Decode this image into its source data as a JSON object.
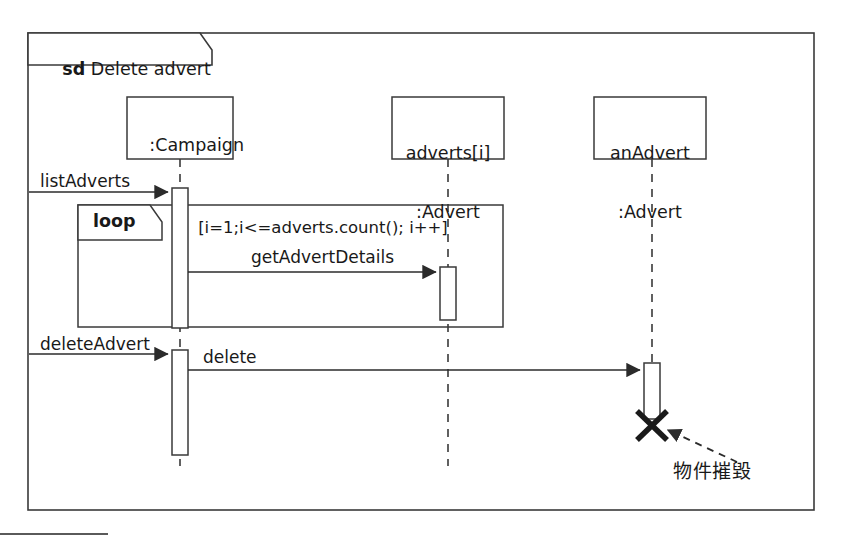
{
  "diagram": {
    "type": "uml-sequence-diagram",
    "frame": {
      "kind_keyword": "sd",
      "title": "Delete advert"
    },
    "lifelines": [
      {
        "id": "campaign",
        "label_line1": ":Campaign",
        "label_line2": ""
      },
      {
        "id": "adverts-i",
        "label_line1": "adverts[i]",
        "label_line2": ":Advert"
      },
      {
        "id": "anadvert",
        "label_line1": "anAdvert",
        "label_line2": ":Advert"
      }
    ],
    "fragment": {
      "operator": "loop",
      "guard": "[i=1;i<=adverts.count(); i++]"
    },
    "messages": [
      {
        "id": "list-adverts",
        "label": "listAdverts",
        "from": "actor-boundary",
        "to": "campaign",
        "style": "solid-filled-arrow"
      },
      {
        "id": "get-advert-details",
        "label": "getAdvertDetails",
        "from": "campaign",
        "to": "adverts-i",
        "style": "solid-filled-arrow"
      },
      {
        "id": "delete-advert",
        "label": "deleteAdvert",
        "from": "actor-boundary",
        "to": "campaign",
        "style": "solid-filled-arrow"
      },
      {
        "id": "delete",
        "label": "delete",
        "from": "campaign",
        "to": "anadvert",
        "style": "solid-filled-arrow"
      }
    ],
    "destruction": {
      "marker": "X",
      "note": "物件摧毀"
    },
    "colors": {
      "stroke": "#2b2b2b",
      "background": "#ffffff",
      "text": "#191919"
    }
  }
}
